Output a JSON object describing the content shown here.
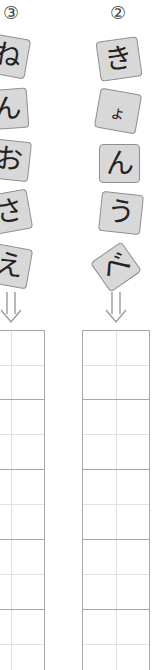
{
  "columns": [
    {
      "id": "col-3",
      "number": "③",
      "tiles": [
        "ね",
        "ん",
        "お",
        "さ",
        "え"
      ],
      "arrow": "double-down-arrow",
      "grid_cells": 5
    },
    {
      "id": "col-2",
      "number": "②",
      "tiles": [
        "き",
        "ょ",
        "ん",
        "う",
        "べ"
      ],
      "arrow": "double-down-arrow",
      "grid_cells": 5
    }
  ],
  "colors": {
    "tile_fill": "#d8d8d8",
    "tile_border": "#8f8f8f",
    "grid_line": "#a8a8a8",
    "grid_guide": "#e2e2e2",
    "arrow": "#9a9a9a"
  }
}
